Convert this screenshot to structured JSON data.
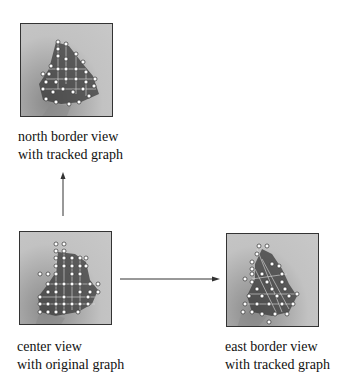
{
  "panels": {
    "north": {
      "caption_line1": "north border view",
      "caption_line2": "with tracked graph"
    },
    "center": {
      "caption_line1": "center view",
      "caption_line2": "with original graph"
    },
    "east": {
      "caption_line1": "east border view",
      "caption_line2": "with tracked graph"
    }
  },
  "arrows": [
    {
      "from": "center",
      "to": "north",
      "direction": "up"
    },
    {
      "from": "center",
      "to": "east",
      "direction": "right"
    }
  ],
  "colors": {
    "line": "#333333",
    "panel_bg": "#c2c2c2",
    "blob": "#3a3a3a",
    "node": "#ffffff"
  }
}
